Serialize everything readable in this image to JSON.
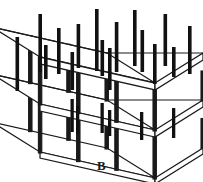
{
  "figure": {
    "caption": "B",
    "type": "isometric-line-drawing",
    "colors": {
      "background": "#ffffff",
      "line": "#1a1a1a",
      "rebar": "#111111",
      "rule": "#d4d4d4",
      "caption": "#1a1a1a"
    },
    "view": {
      "projection": "isometric",
      "dx_right": 115,
      "dy_right": 26,
      "dx_depth": -48,
      "dy_depth": 30,
      "origin_x": 40,
      "origin_y": 104
    },
    "frame": {
      "bays_along_length": 3,
      "bays_along_depth": 1,
      "storeys": 2,
      "storey_height": 47,
      "slab_thickness": 6,
      "column_width": 3.4,
      "beam_width": 2.4
    },
    "rebar": {
      "count": 16,
      "thickness": 3.6,
      "note": "vertical starter bars projecting above the upper slab",
      "bars": [
        {
          "u": 0.0,
          "v": 0.0,
          "len": 54
        },
        {
          "u": 0.0,
          "v": 1.0,
          "len": 40
        },
        {
          "u": 0.33,
          "v": 0.0,
          "len": 58
        },
        {
          "u": 0.33,
          "v": 0.52,
          "len": 34
        },
        {
          "u": 0.33,
          "v": 1.0,
          "len": 46
        },
        {
          "u": 0.52,
          "v": 0.0,
          "len": 44
        },
        {
          "u": 0.66,
          "v": 0.0,
          "len": 62
        },
        {
          "u": 0.66,
          "v": 0.48,
          "len": 36
        },
        {
          "u": 0.66,
          "v": 1.0,
          "len": 50
        },
        {
          "u": 0.82,
          "v": 0.22,
          "len": 40
        },
        {
          "u": 1.0,
          "v": 0.0,
          "len": 56
        },
        {
          "u": 1.0,
          "v": 0.5,
          "len": 42
        },
        {
          "u": 1.0,
          "v": 1.0,
          "len": 52
        },
        {
          "u": 0.16,
          "v": 0.32,
          "len": 34
        },
        {
          "u": 0.49,
          "v": 0.3,
          "len": 38
        },
        {
          "u": 0.85,
          "v": 0.7,
          "len": 30
        }
      ]
    }
  }
}
